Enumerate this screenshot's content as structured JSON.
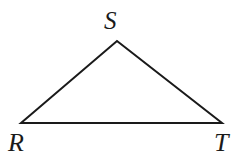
{
  "figure": {
    "type": "geometry-diagram",
    "shape": "triangle",
    "background_color": "#ffffff",
    "stroke_color": "#1a1a1a",
    "stroke_width": 2,
    "canvas": {
      "width": 245,
      "height": 164
    },
    "vertices": [
      {
        "id": "R",
        "label": "R",
        "x": 21,
        "y": 123
      },
      {
        "id": "S",
        "label": "S",
        "x": 117,
        "y": 41
      },
      {
        "id": "T",
        "label": "T",
        "x": 222,
        "y": 123
      }
    ],
    "edges": [
      {
        "id": "RS",
        "from": "R",
        "to": "S"
      },
      {
        "id": "ST",
        "from": "S",
        "to": "T"
      },
      {
        "id": "RT",
        "from": "R",
        "to": "T"
      }
    ],
    "polygon_points": "21,123 117,41 222,123",
    "labels": {
      "apex": "S",
      "bottom_left": "R",
      "bottom_right": "T"
    }
  }
}
